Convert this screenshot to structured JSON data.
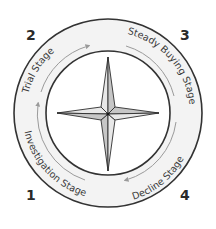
{
  "diagram": {
    "colors": {
      "ring_fill": "#f2f2f2",
      "ring_stroke": "#333333",
      "arrow": "#9a9a9a",
      "star_light": "#e6e6e6",
      "star_dark": "#c4c4c4",
      "star_stroke": "#2e2e2e"
    },
    "stages": [
      {
        "number": "1",
        "label": "Investigation Stage"
      },
      {
        "number": "2",
        "label": "Trial Stage"
      },
      {
        "number": "3",
        "label": "Steady Buying Stage"
      },
      {
        "number": "4",
        "label": "Decline Stage"
      }
    ],
    "center_icon": "four-point-compass-star"
  }
}
